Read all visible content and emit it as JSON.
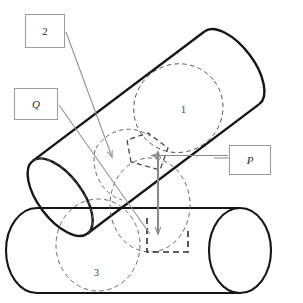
{
  "figure": {
    "type": "technical-line-diagram",
    "background_color": "#ffffff",
    "solid_line_color": "#1a1a1a",
    "hidden_line_color": "#555555",
    "leader_line_color": "#8c8c8c",
    "arrow_color": "#8a8a8a",
    "box_border_color": "#9a9a9a"
  },
  "callouts": [
    {
      "id": "two",
      "label": "2",
      "italic": false,
      "x": 25,
      "y": 14,
      "w": 40,
      "h": 34
    },
    {
      "id": "q",
      "label": "Q",
      "italic": true,
      "x": 14,
      "y": 88,
      "w": 44,
      "h": 32
    },
    {
      "id": "p",
      "label": "P",
      "italic": true,
      "x": 229,
      "y": 145,
      "w": 42,
      "h": 30
    }
  ],
  "inline_labels": [
    {
      "id": "cylinder-1-number",
      "label": "1",
      "x": 181,
      "y": 105
    },
    {
      "id": "cylinder-3-number",
      "label": "3",
      "x": 94,
      "y": 268
    }
  ],
  "cylinders": [
    {
      "id": "cylinder-1",
      "name": "diagonal-cylinder",
      "label": "1",
      "orientation": "diagonal",
      "angle_degrees": -37
    },
    {
      "id": "cylinder-3",
      "name": "horizontal-cylinder",
      "label": "3",
      "orientation": "horizontal",
      "angle_degrees": 0
    }
  ],
  "annotations": {
    "vertical_double_arrow": {
      "name": "distance-double-arrow",
      "x": 158,
      "y_top": 150,
      "y_bottom": 236
    },
    "horizontal_left_arrow": {
      "name": "p-pointer-arrow",
      "x_from": 226,
      "x_to": 152,
      "y": 155
    },
    "leader_2": {
      "name": "leader-line-2",
      "from_x": 65,
      "from_y": 31,
      "to_x": 112,
      "to_y": 158
    },
    "leader_q": {
      "name": "leader-line-q",
      "from_x": 58,
      "from_y": 104,
      "to_x": 148,
      "to_y": 232
    }
  }
}
